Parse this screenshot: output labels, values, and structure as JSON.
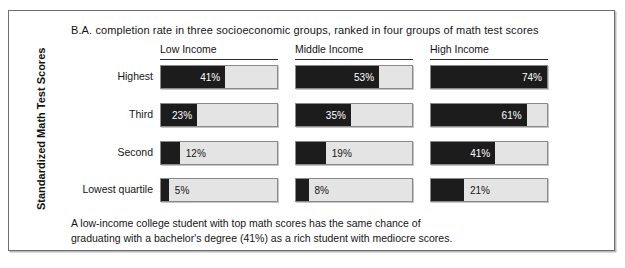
{
  "chart_data": {
    "type": "bar",
    "orientation": "horizontal",
    "title": "B.A. completion rate in three socioeconomic groups, ranked in four groups of math test scores",
    "xlabel": "",
    "ylabel": "Standardized Math Test Scores",
    "categories": [
      "Highest",
      "Third",
      "Second",
      "Lowest quartile"
    ],
    "group_labels": [
      "Low Income",
      "Middle Income",
      "High Income"
    ],
    "series": [
      {
        "name": "Low Income",
        "values": [
          41,
          23,
          12,
          5
        ]
      },
      {
        "name": "Middle Income",
        "values": [
          53,
          35,
          19,
          8
        ]
      },
      {
        "name": "High Income",
        "values": [
          74,
          61,
          41,
          21
        ]
      }
    ],
    "value_labels": [
      [
        "41%",
        "23%",
        "12%",
        "5%"
      ],
      [
        "53%",
        "35%",
        "19%",
        "8%"
      ],
      [
        "74%",
        "61%",
        "41%",
        "21%"
      ]
    ],
    "xlim": [
      0,
      74
    ],
    "unit": "%",
    "grid": false,
    "legend": "none",
    "colors": {
      "bar_fill": "#1c1c1c",
      "bar_track": "#e4e4e4",
      "bar_border": "#8a8a8a",
      "frame_border": "#6e6e6e",
      "text": "#151515",
      "value_text_inside": "#ffffff"
    },
    "annotation": "A low-income college student with top math scores has the same chance of graduating with a bachelor's degree (41%) as a rich student with mediocre scores."
  },
  "caption": {
    "line1": "A low-income college student with top math scores has the same chance of",
    "line2": "graduating with a bachelor's degree (41%) as a rich student with mediocre scores."
  }
}
